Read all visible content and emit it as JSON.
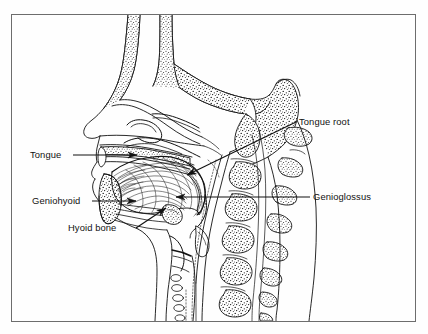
{
  "figure": {
    "type": "anatomical-diagram",
    "view": "mid-sagittal",
    "line_color": "#111111",
    "background_color": "#fefefe",
    "frame_color": "#6d6d6d",
    "labels": [
      {
        "id": "tongue",
        "text": "Tongue",
        "text_x": 30,
        "text_y": 158,
        "anchor": "start",
        "leader": "M 73,155 L 137,155",
        "arrow_x": 137,
        "arrow_y": 155,
        "arrow_angle": 0
      },
      {
        "id": "tongue-root",
        "text": "Tongue root",
        "text_x": 299,
        "text_y": 125,
        "anchor": "start",
        "leader": "M 296,122 L 187,175",
        "arrow_x": 187,
        "arrow_y": 175,
        "arrow_angle": 154
      },
      {
        "id": "geniohyoid",
        "text": "Geniohyoid",
        "text_x": 32,
        "text_y": 204,
        "anchor": "start",
        "leader": "M 92,201 L 136,201",
        "arrow_x": 136,
        "arrow_y": 201,
        "arrow_angle": 0
      },
      {
        "id": "genioglossus",
        "text": "Genioglossus",
        "text_x": 313,
        "text_y": 200,
        "anchor": "start",
        "leader": "M 310,197 L 176,197",
        "arrow_x": 176,
        "arrow_y": 197,
        "arrow_angle": 180
      },
      {
        "id": "hyoid-bone",
        "text": "Hyoid bone",
        "text_x": 68,
        "text_y": 231,
        "anchor": "start",
        "leader": "M 136,228 L 166,208",
        "arrow_x": 166,
        "arrow_y": 208,
        "arrow_angle": -34
      }
    ]
  }
}
